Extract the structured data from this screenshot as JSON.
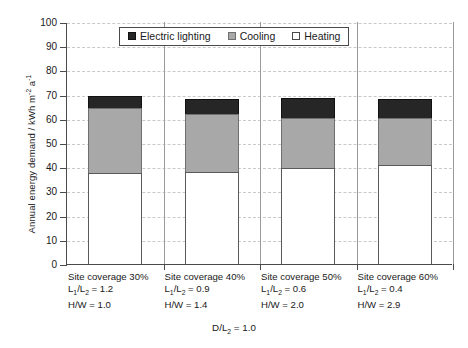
{
  "chart_data": {
    "type": "bar",
    "stacked": true,
    "title": "",
    "xlabel": "D/L2 = 1.0",
    "ylabel": "Annual energy demand / kWh m-2 a-1",
    "ylim": [
      0,
      100
    ],
    "ytick_step": 10,
    "yticks": [
      0,
      10,
      20,
      30,
      40,
      50,
      60,
      70,
      80,
      90,
      100
    ],
    "grid": true,
    "legend_position": "top-center",
    "categories": [
      "Site coverage 30%",
      "Site coverage 40%",
      "Site coverage 50%",
      "Site coverage 60%"
    ],
    "series": [
      {
        "name": "Heating",
        "values": [
          37.5,
          38.0,
          39.5,
          41.0
        ],
        "color": "#ffffff"
      },
      {
        "name": "Cooling",
        "values": [
          27.0,
          24.0,
          21.0,
          19.5
        ],
        "color": "#a8a8a8"
      },
      {
        "name": "Electric lighting",
        "values": [
          5.0,
          6.0,
          8.0,
          7.5
        ],
        "color": "#262626"
      }
    ],
    "totals": [
      69.5,
      68.0,
      68.5,
      68.0
    ]
  },
  "yaxis": {
    "title_main": "Annual energy demand / kWh m",
    "title_sup1": "-2",
    "title_mid": " a",
    "title_sup2": "-1",
    "ticks": [
      "100",
      "90",
      "80",
      "70",
      "60",
      "50",
      "40",
      "30",
      "20",
      "10",
      "0"
    ]
  },
  "legend": {
    "items": [
      {
        "label": "Electric lighting",
        "swatch": "black-square-icon"
      },
      {
        "label": "Cooling",
        "swatch": "gray-square-icon"
      },
      {
        "label": "Heating",
        "swatch": "white-square-icon"
      }
    ]
  },
  "categories": [
    {
      "coverage": "Site coverage 30%",
      "ratio_prefix": "L",
      "ratio_sub1": "1",
      "ratio_mid": "/L",
      "ratio_sub2": "2",
      "ratio_value": " = 1.2",
      "hw": "H/W = 1.0"
    },
    {
      "coverage": "Site coverage 40%",
      "ratio_prefix": "L",
      "ratio_sub1": "1",
      "ratio_mid": "/L",
      "ratio_sub2": "2",
      "ratio_value": " = 0.9",
      "hw": "H/W = 1.4"
    },
    {
      "coverage": "Site coverage 50%",
      "ratio_prefix": "L",
      "ratio_sub1": "1",
      "ratio_mid": "/L",
      "ratio_sub2": "2",
      "ratio_value": " = 0.6",
      "hw": "H/W = 2.0"
    },
    {
      "coverage": "Site coverage 60%",
      "ratio_prefix": "L",
      "ratio_sub1": "1",
      "ratio_mid": "/L",
      "ratio_sub2": "2",
      "ratio_value": " = 0.4",
      "hw": "H/W = 2.9"
    }
  ],
  "xaxis_note": {
    "prefix": "D/L",
    "sub": "2",
    "value": " = 1.0"
  },
  "colors": {
    "electric_lighting": "#262626",
    "cooling": "#a8a8a8",
    "heating": "#ffffff",
    "axis": "#4a4a4a",
    "grid": "#c9c9c9"
  }
}
